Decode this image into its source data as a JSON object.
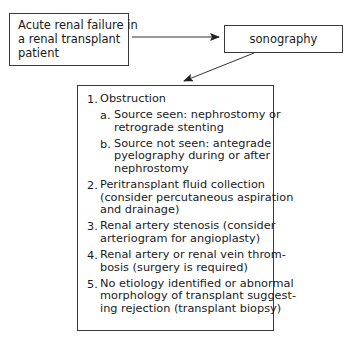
{
  "diagram": {
    "start": {
      "lines": [
        "Acute renal failure in",
        "a renal transplant",
        "patient"
      ]
    },
    "test": {
      "label": "sonography"
    },
    "results": {
      "items": [
        {
          "num": "1.",
          "lines": [
            "Obstruction"
          ],
          "subitems": [
            {
              "num": "a.",
              "lines": [
                "Source seen: nephrostomy or",
                "retrograde stenting"
              ]
            },
            {
              "num": "b.",
              "lines": [
                "Source not seen: antegrade",
                "pyelography during or after",
                "nephrostomy"
              ]
            }
          ]
        },
        {
          "num": "2.",
          "lines": [
            "Peritransplant fluid collection",
            "(consider percutaneous aspiration",
            "and drainage)"
          ]
        },
        {
          "num": "3.",
          "lines": [
            "Renal artery stenosis (consider",
            "arteriogram for angioplasty)"
          ]
        },
        {
          "num": "4.",
          "lines": [
            "Renal artery or renal vein throm-",
            "bosis (surgery is required)"
          ]
        },
        {
          "num": "5.",
          "lines": [
            "No etiology identified or abnormal",
            "morphology of transplant suggest-",
            "ing rejection (transplant biopsy)"
          ]
        }
      ]
    },
    "edges": [
      {
        "from": "start",
        "to": "test",
        "direction": "right"
      },
      {
        "from": "test",
        "to": "results",
        "direction": "down-left"
      }
    ],
    "colors": {
      "stroke": "#3a3a3a",
      "text": "#1a1a1a",
      "background": "#ffffff"
    }
  }
}
